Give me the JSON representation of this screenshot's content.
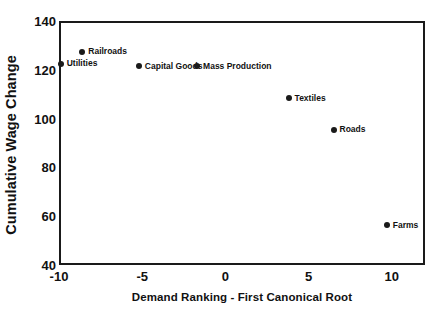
{
  "chart_data": {
    "type": "scatter",
    "title": "",
    "xlabel": "Demand Ranking - First Canonical Root",
    "ylabel": "Cumulative Wage Change",
    "xlim": [
      -10,
      12
    ],
    "ylim": [
      40,
      140
    ],
    "xticks": [
      "-10",
      "-5",
      "0",
      "5",
      "10"
    ],
    "xtick_values": [
      -10,
      -5,
      0,
      5,
      10
    ],
    "yticks": [
      "140",
      "120",
      "100",
      "80",
      "60",
      "40"
    ],
    "ytick_values": [
      140,
      120,
      100,
      80,
      60,
      40
    ],
    "grid": false,
    "legend": "none",
    "point_color": "#1a1a1a",
    "frame_color": "#1a1a1a",
    "background": "#ffffff",
    "points": [
      {
        "label": "Utilities",
        "x": -9.9,
        "y": 123
      },
      {
        "label": "Railroads",
        "x": -8.6,
        "y": 128
      },
      {
        "label": "Capital Goods",
        "x": -5.2,
        "y": 122
      },
      {
        "label": "Mass Production",
        "x": -1.7,
        "y": 122
      },
      {
        "label": "Textiles",
        "x": 3.8,
        "y": 109
      },
      {
        "label": "Roads",
        "x": 6.5,
        "y": 96
      },
      {
        "label": "Farms",
        "x": 9.7,
        "y": 57
      }
    ]
  }
}
